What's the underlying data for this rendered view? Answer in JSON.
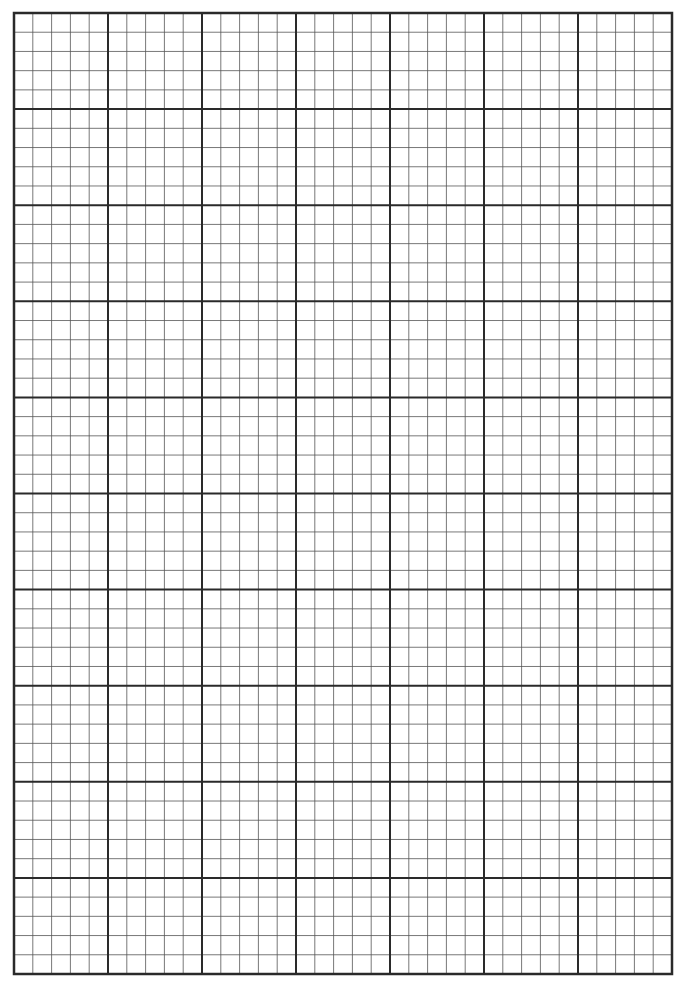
{
  "sheet": {
    "type": "graph-paper",
    "background": "#ffffff",
    "line_color_major": "#2a2a2a",
    "line_color_minor": "#555555",
    "origin_x": 14,
    "origin_y": 13,
    "width": 658,
    "height": 961,
    "major_columns": 7,
    "major_rows": 10,
    "minor_per_major": 5,
    "major_line_width": 2,
    "minor_line_width": 0.8,
    "border_line_width": 2.5
  }
}
